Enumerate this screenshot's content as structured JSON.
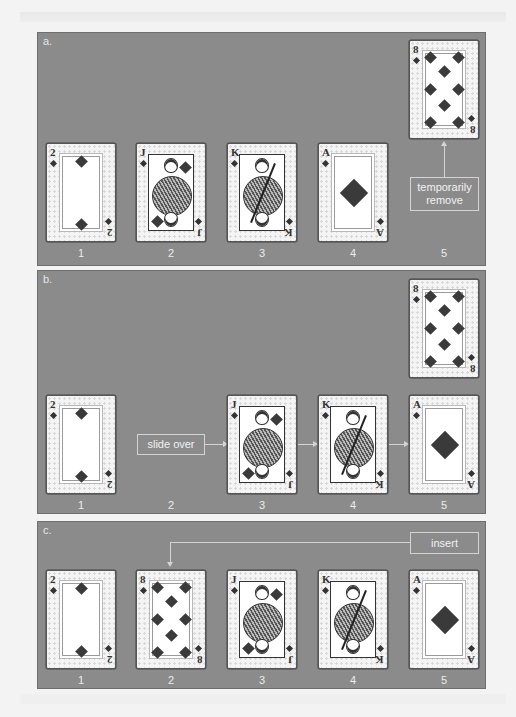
{
  "colors": {
    "panel_bg": "#8b8b8b",
    "page_bg": "#f3f3f3",
    "label_text": "#f2f2f2",
    "suit": "#3a3a3a"
  },
  "panels": [
    {
      "label": "a.",
      "slots": [
        "1",
        "2",
        "3",
        "4",
        "5"
      ],
      "cards": [
        {
          "rank": "2",
          "suit": "diamond-icon",
          "slot": "1"
        },
        {
          "rank": "J",
          "suit": "diamond-icon",
          "slot": "2"
        },
        {
          "rank": "K",
          "suit": "diamond-icon",
          "slot": "3"
        },
        {
          "rank": "A",
          "suit": "diamond-icon",
          "slot": "4"
        },
        {
          "rank": "8",
          "suit": "diamond-icon",
          "slot": "5 (lifted)"
        }
      ],
      "annotation": "temporarily remove"
    },
    {
      "label": "b.",
      "slots": [
        "1",
        "2",
        "3",
        "4",
        "5"
      ],
      "cards": [
        {
          "rank": "2",
          "suit": "diamond-icon",
          "slot": "1"
        },
        {
          "rank": "J",
          "suit": "diamond-icon",
          "slot": "3"
        },
        {
          "rank": "K",
          "suit": "diamond-icon",
          "slot": "4"
        },
        {
          "rank": "A",
          "suit": "diamond-icon",
          "slot": "5"
        },
        {
          "rank": "8",
          "suit": "diamond-icon",
          "slot": "held"
        }
      ],
      "annotation": "slide over"
    },
    {
      "label": "c.",
      "slots": [
        "1",
        "2",
        "3",
        "4",
        "5"
      ],
      "cards": [
        {
          "rank": "2",
          "suit": "diamond-icon",
          "slot": "1"
        },
        {
          "rank": "8",
          "suit": "diamond-icon",
          "slot": "2"
        },
        {
          "rank": "J",
          "suit": "diamond-icon",
          "slot": "3"
        },
        {
          "rank": "K",
          "suit": "diamond-icon",
          "slot": "4"
        },
        {
          "rank": "A",
          "suit": "diamond-icon",
          "slot": "5"
        }
      ],
      "annotation": "insert"
    }
  ]
}
